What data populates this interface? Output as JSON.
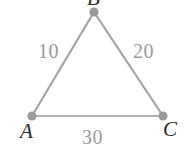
{
  "figure": {
    "background_color": "#ffffff",
    "edge_color": "#a0a0a0",
    "vertex_color": "#9a9a9a",
    "weight_label_color": "#9a9a9a",
    "vertex_label_color": "#2b2b2b",
    "edge_stroke_width": 2,
    "vertex_radius": 4.5
  },
  "graph": {
    "type": "weighted-undirected-triangle",
    "vertices": [
      {
        "id": "A",
        "label": "A",
        "x": 32,
        "y": 116
      },
      {
        "id": "B",
        "label": "B",
        "x": 94,
        "y": 12
      },
      {
        "id": "C",
        "label": "C",
        "x": 163,
        "y": 116
      }
    ],
    "edges": [
      {
        "id": "AB",
        "from": "A",
        "to": "B",
        "weight": "10"
      },
      {
        "id": "BC",
        "from": "B",
        "to": "C",
        "weight": "20"
      },
      {
        "id": "CA",
        "from": "C",
        "to": "A",
        "weight": "30"
      }
    ]
  },
  "labels": {
    "vertex_a": "A",
    "vertex_b": "B",
    "vertex_c": "C",
    "weight_ab": "10",
    "weight_bc": "20",
    "weight_ca": "30"
  }
}
